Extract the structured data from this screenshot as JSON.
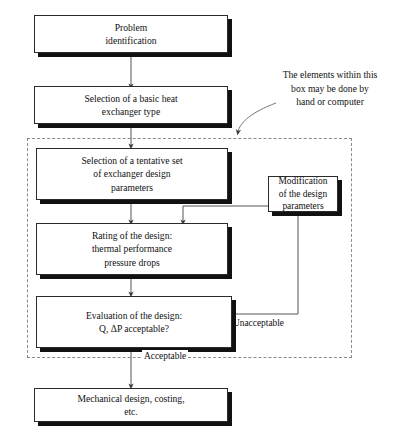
{
  "diagram": {
    "nodes": [
      {
        "id": "problem",
        "text": "Problem\nidentification"
      },
      {
        "id": "basic_type",
        "text": "Selection of a basic heat\nexchanger type"
      },
      {
        "id": "tentative",
        "text": "Selection of a tentative set\nof exchanger design\nparameters"
      },
      {
        "id": "rating",
        "text": "Rating of the design:\nthermal performance\npressure drops"
      },
      {
        "id": "evaluation",
        "text": "Evaluation of the design:\nQ, ΔP acceptable?"
      },
      {
        "id": "modification",
        "text": "Modification\nof the design\nparameters"
      },
      {
        "id": "mechanical",
        "text": "Mechanical design, costing,\netc."
      }
    ],
    "edge_labels": [
      {
        "id": "unacceptable",
        "text": "Unacceptable"
      },
      {
        "id": "acceptable",
        "text": "Acceptable"
      }
    ],
    "annotation": "The elements within this\nbox may be done by\nhand or computer",
    "colors": {
      "box_fill": "#ffffff",
      "box_border": "#2b2b2b",
      "box_shadow": "#111111",
      "connector": "#555555",
      "dashed_border": "#8a8a8a",
      "text": "#111111"
    }
  }
}
